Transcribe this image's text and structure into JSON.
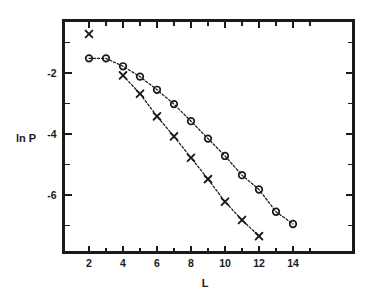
{
  "chart_data": {
    "type": "scatter",
    "title": "",
    "xlabel": "L",
    "ylabel": "ln P",
    "xlim": [
      1.0,
      15.2
    ],
    "ylim": [
      -7.6,
      -0.15
    ],
    "grid": false,
    "legend": "none",
    "x_ticks_major": [
      2,
      4,
      6,
      8,
      10,
      12,
      14
    ],
    "x_ticks_minor": [
      3,
      5,
      7,
      9,
      11,
      13,
      15
    ],
    "x_tick_labels": [
      "2",
      "4",
      "6",
      "8",
      "10",
      "12",
      "14"
    ],
    "y_ticks_major": [
      -2,
      -4,
      -6
    ],
    "y_ticks_minor": [
      -1,
      -3,
      -5,
      -7
    ],
    "y_tick_labels": [
      "-2",
      "-4",
      "-6"
    ],
    "series": [
      {
        "name": "circles",
        "marker": "open-circle",
        "line": "dotted",
        "x": [
          2,
          3,
          4,
          5,
          6,
          7,
          8,
          9,
          10,
          11,
          12,
          13,
          14
        ],
        "y": [
          -1.52,
          -1.52,
          -1.78,
          -2.12,
          -2.55,
          -3.02,
          -3.58,
          -4.15,
          -4.72,
          -5.35,
          -5.82,
          -6.55,
          -6.95
        ]
      },
      {
        "name": "crosses",
        "marker": "x",
        "line": "dotted",
        "x": [
          4,
          5,
          6,
          7,
          8,
          9,
          10,
          11,
          12
        ],
        "y": [
          -2.08,
          -2.68,
          -3.42,
          -4.08,
          -4.78,
          -5.48,
          -6.22,
          -6.82,
          -7.35
        ]
      },
      {
        "name": "stray-cross",
        "marker": "x",
        "line": "none",
        "x": [
          2
        ],
        "y": [
          -0.72
        ]
      }
    ]
  },
  "figure": {
    "x_axis_title": "L",
    "y_axis_title": "ln P"
  }
}
